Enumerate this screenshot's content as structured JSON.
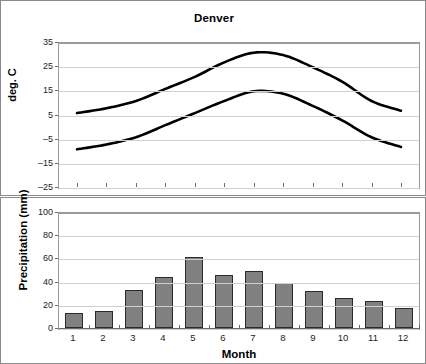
{
  "chart_data": [
    {
      "type": "line",
      "title": "Denver",
      "xlabel": "",
      "ylabel": "deg. C",
      "ylim": [
        -25,
        35
      ],
      "yticks": [
        35,
        25,
        15,
        5,
        -5,
        -15,
        -25
      ],
      "x": [
        1,
        2,
        3,
        4,
        5,
        6,
        7,
        8,
        9,
        10,
        11,
        12
      ],
      "grid": true,
      "legend": "none",
      "series": [
        {
          "name": "High temperature",
          "values": [
            6,
            8,
            11,
            16,
            21,
            27,
            31,
            30,
            25,
            19,
            11,
            7
          ]
        },
        {
          "name": "Low temperature",
          "values": [
            -9,
            -7,
            -4,
            1,
            6,
            11,
            15,
            14,
            9,
            3,
            -4,
            -8
          ]
        }
      ]
    },
    {
      "type": "bar",
      "title": "",
      "xlabel": "Month",
      "ylabel": "Precipitation (mm)",
      "ylim": [
        0,
        100
      ],
      "yticks": [
        100,
        80,
        60,
        40,
        20,
        0
      ],
      "categories": [
        "1",
        "2",
        "3",
        "4",
        "5",
        "6",
        "7",
        "8",
        "9",
        "10",
        "11",
        "12"
      ],
      "values": [
        13,
        15,
        33,
        44,
        61,
        46,
        49,
        39,
        32,
        26,
        23,
        17
      ],
      "grid": true,
      "legend": "none",
      "bar_color": "#808080",
      "bar_border_color": "#2b2b2b"
    }
  ],
  "temperature": {
    "title": "Denver",
    "ylabel": "deg. C",
    "yticks": [
      "35",
      "25",
      "15",
      "5",
      "-5",
      "-15",
      "-25"
    ]
  },
  "precipitation": {
    "ylabel": "Precipitation (mm)",
    "xlabel": "Month",
    "yticks": [
      "100",
      "80",
      "60",
      "40",
      "20",
      "0"
    ],
    "xticks": [
      "1",
      "2",
      "3",
      "4",
      "5",
      "6",
      "7",
      "8",
      "9",
      "10",
      "11",
      "12"
    ]
  },
  "colors": {
    "line": "#000000",
    "bar_fill": "#808080",
    "bar_stroke": "#2b2b2b",
    "grid": "#d0d0d0",
    "frame": "#8a8a8a"
  }
}
